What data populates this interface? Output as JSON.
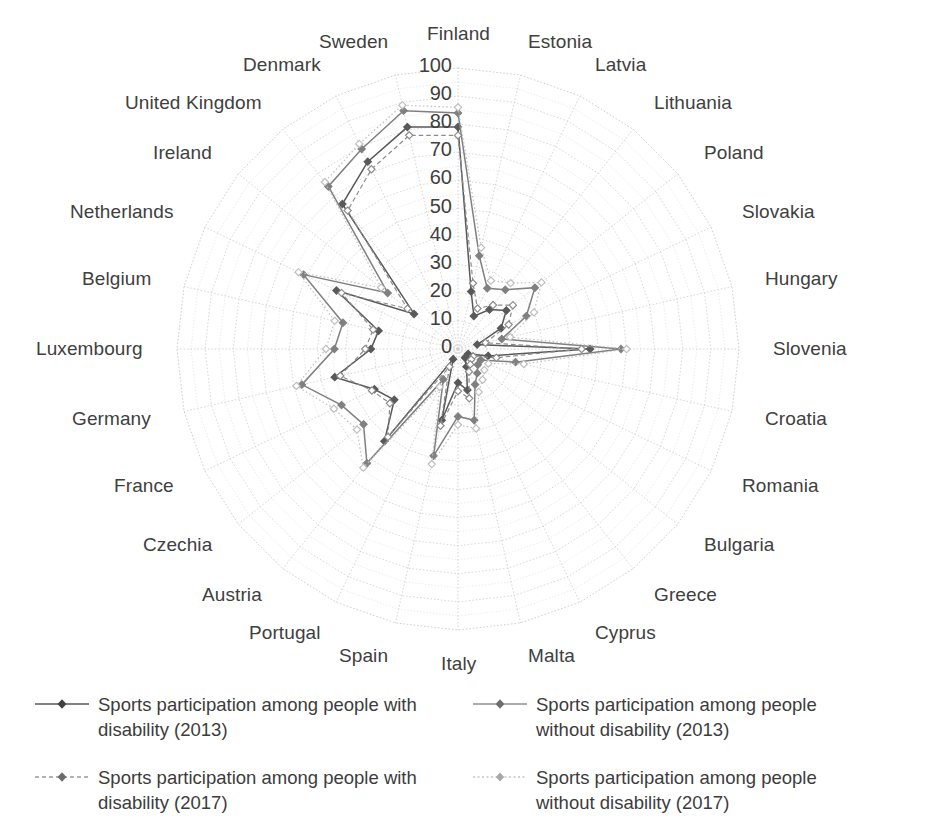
{
  "chart_data": {
    "type": "line",
    "subtype": "radar",
    "title": "",
    "categories": [
      "Finland",
      "Estonia",
      "Latvia",
      "Lithuania",
      "Poland",
      "Slovakia",
      "Hungary",
      "Slovenia",
      "Croatia",
      "Romania",
      "Bulgaria",
      "Greece",
      "Cyprus",
      "Malta",
      "Italy",
      "Spain",
      "Portugal",
      "Austria",
      "Czechia",
      "France",
      "Germany",
      "Luxembourg",
      "Belgium",
      "Netherlands",
      "Ireland",
      "United Kingdom",
      "Denmark",
      "Sweden"
    ],
    "rlim": [
      0,
      100
    ],
    "rticks": [
      0,
      10,
      20,
      30,
      40,
      50,
      60,
      70,
      80,
      90,
      100
    ],
    "rtick_labels": [
      "0",
      "10",
      "20",
      "30",
      "40",
      "50",
      "60",
      "70",
      "80",
      "90",
      "100"
    ],
    "grid": true,
    "legend_position": "bottom",
    "series": [
      {
        "name": "Sports participation among people with disability (2013)",
        "year": "2013",
        "group": "with disability",
        "color": "#595959",
        "style": "solid",
        "marker": "diamond",
        "values": [
          79,
          21,
          13,
          18,
          22,
          17,
          7,
          47,
          11,
          4,
          4,
          4,
          7,
          15,
          12,
          26,
          4,
          42,
          29,
          33,
          45,
          31,
          29,
          48,
          20,
          66,
          74,
          81
        ]
      },
      {
        "name": "Sports participation among people without disability (2013)",
        "year": "2013",
        "group": "without disability",
        "color": "#808080",
        "style": "solid",
        "marker": "diamond",
        "values": [
          84,
          34,
          24,
          27,
          35,
          27,
          16,
          58,
          21,
          9,
          9,
          11,
          14,
          26,
          24,
          39,
          12,
          52,
          43,
          46,
          57,
          44,
          42,
          61,
          32,
          74,
          79,
          87
        ]
      },
      {
        "name": "Sports participation among people with disability (2017)",
        "year": "2017",
        "group": "with disability",
        "color": "#8c8c8c",
        "style": "dashed",
        "marker": "diamond",
        "values": [
          76,
          24,
          16,
          20,
          25,
          20,
          10,
          44,
          14,
          6,
          6,
          7,
          9,
          18,
          15,
          28,
          7,
          40,
          31,
          34,
          43,
          33,
          31,
          46,
          23,
          63,
          71,
          78
        ]
      },
      {
        "name": "Sports participation among people without disability (2017)",
        "year": "2017",
        "group": "without disability",
        "color": "#bfbfbf",
        "style": "dotted",
        "marker": "diamond",
        "values": [
          86,
          37,
          27,
          30,
          38,
          30,
          19,
          60,
          24,
          12,
          12,
          14,
          17,
          29,
          27,
          42,
          15,
          54,
          46,
          49,
          59,
          47,
          45,
          63,
          35,
          76,
          81,
          89
        ]
      }
    ]
  },
  "legend": {
    "items": [
      {
        "label": "Sports participation among people with disability (2013)"
      },
      {
        "label": "Sports participation among people without disability (2013)"
      },
      {
        "label": "Sports participation among people with disability (2017)"
      },
      {
        "label": "Sports participation among people without disability (2017)"
      }
    ]
  }
}
